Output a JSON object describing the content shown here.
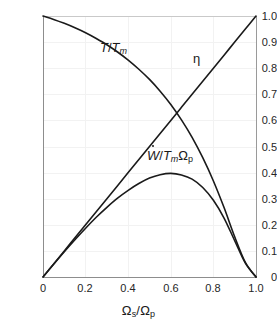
{
  "chart": {
    "background_color": "#ffffff",
    "curve_color": "#1a1a1a",
    "grid_color": "#f2f2f2",
    "axis_color": "#8d8d8d"
  },
  "axes": {
    "x": {
      "label_parts": {
        "omega": "Ω",
        "sub_s": "s",
        "slash": "/",
        "omega2": "Ω",
        "sub_p": "p"
      },
      "label_text": "Ωs/Ωp",
      "ticks": [
        "0",
        "0.2",
        "0.4",
        "0.6",
        "0.8",
        "1.0"
      ],
      "tick_values": [
        0,
        0.2,
        0.4,
        0.6,
        0.8,
        1.0
      ],
      "min": 0,
      "max": 1.0
    },
    "y": {
      "label_text": "",
      "ticks": [
        "0",
        "0.1",
        "0.2",
        "0.3",
        "0.4",
        "0.5",
        "0.6",
        "0.7",
        "0.8",
        "0.9",
        "1.0"
      ],
      "tick_values": [
        0,
        0.1,
        0.2,
        0.3,
        0.4,
        0.5,
        0.6,
        0.7,
        0.8,
        0.9,
        1.0
      ],
      "min": 0,
      "max": 1.0
    }
  },
  "annotations": {
    "temperature_ratio": {
      "text": "T/Tm",
      "x": 0.27,
      "y": 0.845
    },
    "efficiency": {
      "text": "η",
      "x": 0.66,
      "y": 0.805
    },
    "power_ratio": {
      "text": "W/TmΩp",
      "x": 0.47,
      "y": 0.455
    }
  },
  "chart_data": {
    "type": "line",
    "title": "",
    "xlabel": "Ωs/Ωp",
    "ylabel": "",
    "xlim": [
      0,
      1.0
    ],
    "ylim": [
      0,
      1.0
    ],
    "grid": true,
    "legend": "none (inline curve annotations)",
    "x": [
      0,
      0.05,
      0.1,
      0.15,
      0.2,
      0.25,
      0.3,
      0.35,
      0.4,
      0.45,
      0.5,
      0.55,
      0.6,
      0.65,
      0.7,
      0.75,
      0.8,
      0.85,
      0.9,
      0.95,
      1.0
    ],
    "series": [
      {
        "name": "T/Tm",
        "label": "T/Tₘ",
        "description": "Normalized torque, decreases monotonically from 1 at Ωs/Ωp = 0 to 0 at Ωs/Ωp = 1",
        "values": [
          1.0,
          0.987,
          0.972,
          0.955,
          0.936,
          0.914,
          0.89,
          0.862,
          0.831,
          0.796,
          0.757,
          0.712,
          0.661,
          0.602,
          0.535,
          0.457,
          0.368,
          0.266,
          0.154,
          0.056,
          0.0
        ]
      },
      {
        "name": "eta",
        "label": "η",
        "description": "Efficiency, straight line from (0,0) to (1,1)",
        "values": [
          0,
          0.05,
          0.1,
          0.15,
          0.2,
          0.25,
          0.3,
          0.35,
          0.4,
          0.45,
          0.5,
          0.55,
          0.6,
          0.65,
          0.7,
          0.75,
          0.8,
          0.85,
          0.9,
          0.95,
          1.0
        ]
      },
      {
        "name": "Wdot/(Tm*Omega_p)",
        "label": "Ẇ/TₘΩₚ",
        "description": "Normalized power output; product of efficiency and torque ratio. Peaks near 0.385 at Ωs/Ωp ≈ 0.66",
        "values": [
          0,
          0.049,
          0.097,
          0.143,
          0.187,
          0.229,
          0.267,
          0.302,
          0.332,
          0.358,
          0.379,
          0.392,
          0.397,
          0.391,
          0.375,
          0.343,
          0.294,
          0.226,
          0.139,
          0.053,
          0.0
        ]
      }
    ],
    "notable_points": {
      "crossing_eta_and_torque": {
        "x": 0.615,
        "y": 0.615
      },
      "power_peak": {
        "x": 0.66,
        "y": 0.385
      }
    }
  }
}
